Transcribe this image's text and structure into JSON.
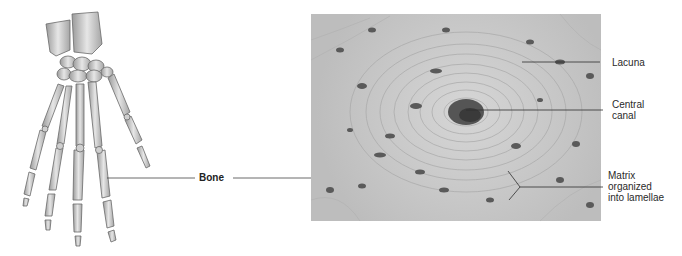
{
  "figure": {
    "left_panel": {
      "subject": "hand skeleton illustration"
    },
    "right_panel": {
      "subject": "compact bone micrograph (osteon cross-section)"
    },
    "labels": {
      "bone": "Bone",
      "lacuna": "Lacuna",
      "central_canal_line1": "Central",
      "central_canal_line2": "canal",
      "matrix_line1": "Matrix",
      "matrix_line2": "organized",
      "matrix_line3": "into lamellae"
    }
  }
}
